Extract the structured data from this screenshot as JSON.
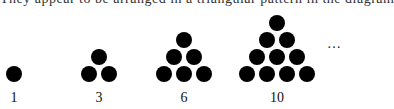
{
  "caption_fragment": "They appear to be arranged in a triangular pattern in the diagram",
  "figure": {
    "groups": [
      {
        "label": "1",
        "rows": 1
      },
      {
        "label": "3",
        "rows": 2
      },
      {
        "label": "6",
        "rows": 3
      },
      {
        "label": "10",
        "rows": 4
      }
    ],
    "continuation": "…",
    "dot_color": "#000000"
  }
}
